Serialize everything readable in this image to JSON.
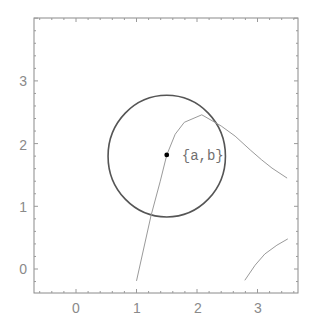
{
  "chart_data": {
    "type": "line",
    "title": "",
    "xlabel": "",
    "ylabel": "",
    "xlim": [
      -0.69,
      3.69
    ],
    "ylim": [
      -0.37,
      4.08
    ],
    "grid": false,
    "frame": true,
    "x_ticks": [
      "0",
      "1",
      "2",
      "3"
    ],
    "y_ticks": [
      "0",
      "1",
      "2",
      "3"
    ],
    "series": [
      {
        "name": "curve-main",
        "color": "#9a9a9a",
        "points": [
          [
            1.0,
            -0.19
          ],
          [
            1.24,
            0.85
          ],
          [
            1.39,
            1.39
          ],
          [
            1.5,
            1.82
          ],
          [
            1.64,
            2.15
          ],
          [
            1.79,
            2.34
          ],
          [
            2.08,
            2.46
          ],
          [
            2.4,
            2.28
          ],
          [
            2.63,
            2.12
          ],
          [
            2.88,
            1.9
          ],
          [
            3.07,
            1.74
          ],
          [
            3.24,
            1.61
          ],
          [
            3.49,
            1.45
          ]
        ]
      },
      {
        "name": "curve-lower-right",
        "color": "#9a9a9a",
        "points": [
          [
            2.79,
            -0.18
          ],
          [
            2.96,
            0.06
          ],
          [
            3.12,
            0.24
          ],
          [
            3.32,
            0.38
          ],
          [
            3.5,
            0.48
          ]
        ]
      }
    ],
    "circle": {
      "center": [
        1.5,
        1.8
      ],
      "radius": 0.97,
      "color": "#555555"
    },
    "point": {
      "x": 1.5,
      "y": 1.82,
      "label": "{a,b}",
      "color": "#000000"
    },
    "annotations": [
      "{a,b}"
    ]
  },
  "labels": {
    "x0": "0",
    "x1": "1",
    "x2": "2",
    "x3": "3",
    "y0": "0",
    "y1": "1",
    "y2": "2",
    "y3": "3",
    "point": "{a,b}"
  }
}
